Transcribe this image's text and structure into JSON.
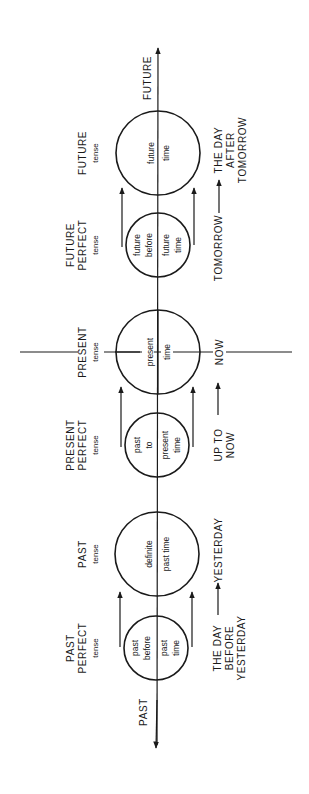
{
  "diagram": {
    "axis": {
      "future_label": "FUTURE",
      "past_label": "PAST"
    },
    "now_line": true,
    "tenses": [
      {
        "id": "future",
        "name_lines": [
          "FUTURE",
          "tense"
        ],
        "circle_left": [
          "future"
        ],
        "circle_right": [
          "time"
        ],
        "time_label_lines": [
          "THE DAY",
          "AFTER",
          "TOMORROW"
        ]
      },
      {
        "id": "future-perfect",
        "name_lines": [
          "FUTURE",
          "PERFECT",
          "tense"
        ],
        "circle_left": [
          "future",
          "before"
        ],
        "circle_right": [
          "future",
          "time"
        ],
        "time_label_lines": [
          "TOMORROW"
        ]
      },
      {
        "id": "present",
        "name_lines": [
          "PRESENT",
          "tense"
        ],
        "circle_left": [
          "present"
        ],
        "circle_right": [
          "time"
        ],
        "time_label_lines": [
          "NOW"
        ]
      },
      {
        "id": "present-perfect",
        "name_lines": [
          "PRESENT",
          "PERFECT",
          "tense"
        ],
        "circle_left": [
          "past",
          "to"
        ],
        "circle_right": [
          "present",
          "time"
        ],
        "time_label_lines": [
          "UP TO",
          "NOW"
        ]
      },
      {
        "id": "past",
        "name_lines": [
          "PAST",
          "tense"
        ],
        "circle_left": [
          "definite"
        ],
        "circle_right": [
          "past time"
        ],
        "time_label_lines": [
          "YESTERDAY"
        ]
      },
      {
        "id": "past-perfect",
        "name_lines": [
          "PAST",
          "PERFECT",
          "tense"
        ],
        "circle_left": [
          "past",
          "before"
        ],
        "circle_right": [
          "past",
          "time"
        ],
        "time_label_lines": [
          "THE DAY",
          "BEFORE",
          "YESTERDAY"
        ]
      }
    ],
    "colors": {
      "ink": "#1a1a1a",
      "background": "#ffffff"
    }
  }
}
